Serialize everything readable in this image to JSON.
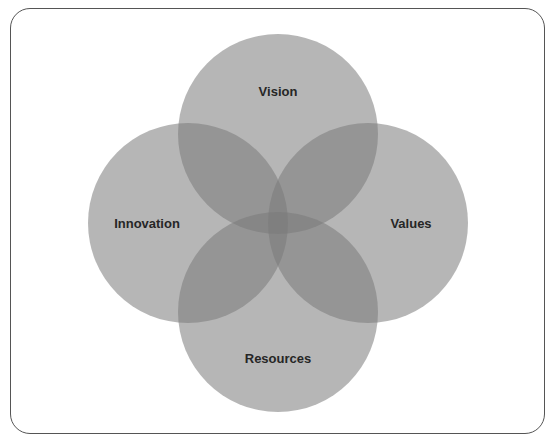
{
  "diagram": {
    "type": "venn",
    "sets": [
      {
        "id": "vision",
        "label": "Vision",
        "cx": 278,
        "cy": 134,
        "r": 100,
        "label_x": 278,
        "label_y": 96
      },
      {
        "id": "innovation",
        "label": "Innovation",
        "cx": 188,
        "cy": 223,
        "r": 100,
        "label_x": 147,
        "label_y": 228
      },
      {
        "id": "values",
        "label": "Values",
        "cx": 368,
        "cy": 223,
        "r": 100,
        "label_x": 411,
        "label_y": 228
      },
      {
        "id": "resources",
        "label": "Resources",
        "cx": 278,
        "cy": 312,
        "r": 100,
        "label_x": 278,
        "label_y": 363
      }
    ],
    "colors": {
      "background": "#ffffff",
      "circle_fill": "#7a7a7a",
      "circle_opacity": "0.55",
      "border": "#555555",
      "text": "#262626"
    }
  }
}
